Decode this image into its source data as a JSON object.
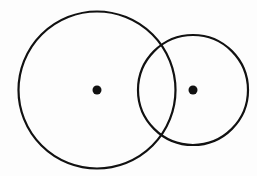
{
  "diagram": {
    "type": "two-intersecting-circles",
    "stroke_color": "#111111",
    "background": "#fdfdfd",
    "circles": [
      {
        "id": "large",
        "cx": 97,
        "cy": 90,
        "r": 78.5,
        "stroke_width": 2.2
      },
      {
        "id": "small",
        "cx": 193,
        "cy": 90,
        "r": 55,
        "stroke_width": 2.2
      }
    ],
    "center_points": [
      {
        "id": "large-center",
        "cx": 97,
        "cy": 90,
        "r": 4.5
      },
      {
        "id": "small-center",
        "cx": 193,
        "cy": 90,
        "r": 4.5
      }
    ]
  }
}
